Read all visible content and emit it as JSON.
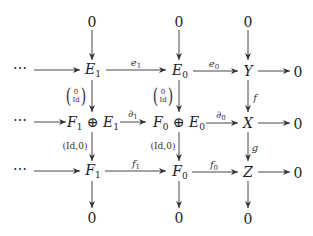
{
  "diagram": {
    "nodes": {
      "top_zero_1": "0",
      "top_zero_2": "0",
      "top_zero_3": "0",
      "r1_dots": "⋯",
      "E1": {
        "base": "E",
        "sub": "1"
      },
      "E0": {
        "base": "E",
        "sub": "0"
      },
      "Y": "Y",
      "r1_zero": "0",
      "r2_dots": "⋯",
      "F1E1": {
        "a": "F",
        "a_sub": "1",
        "op": "⊕",
        "b": "E",
        "b_sub": "1"
      },
      "F0E0": {
        "a": "F",
        "a_sub": "0",
        "op": "⊕",
        "b": "E",
        "b_sub": "0"
      },
      "X": "X",
      "r2_zero": "0",
      "r3_dots": "⋯",
      "F1": {
        "base": "F",
        "sub": "1"
      },
      "F0": {
        "base": "F",
        "sub": "0"
      },
      "Z": "Z",
      "r3_zero": "0",
      "bottom_zero_1": "0",
      "bottom_zero_2": "0",
      "bottom_zero_3": "0"
    },
    "arrow_labels": {
      "e1": {
        "base": "e",
        "sub": "1"
      },
      "e0": {
        "base": "e",
        "sub": "0"
      },
      "d1": {
        "base": "∂",
        "sub": "1"
      },
      "d0": {
        "base": "∂",
        "sub": "0"
      },
      "f1": {
        "base": "f",
        "sub": "1"
      },
      "f0": {
        "base": "f",
        "sub": "0"
      },
      "f": "f",
      "g": "g",
      "inc1": {
        "top": "0",
        "bottom": "Id"
      },
      "inc0": {
        "top": "0",
        "bottom": "Id"
      },
      "proj1": "(Id,0)",
      "proj0": "(Id,0)"
    },
    "colors": {
      "stroke": "#333333",
      "text": "#222222",
      "background": "#ffffff"
    }
  }
}
